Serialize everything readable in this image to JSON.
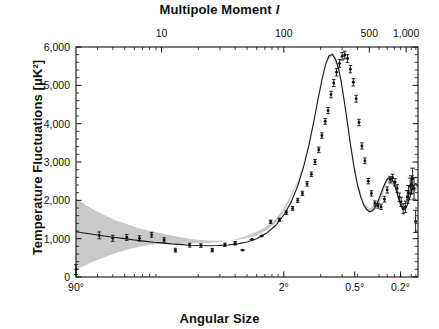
{
  "figure": {
    "top_axis_title_text": "Multipole Moment",
    "top_axis_title_symbol": "l",
    "bottom_axis_title": "Angular Size",
    "y_axis_title": "Temperature Fluctuations [μK²]"
  },
  "chart_data": {
    "type": "line",
    "title": "",
    "subtitle": "",
    "xlabel": "Angular Size",
    "ylabel": "Temperature Fluctuations [μK²]",
    "x_top_label": "Multipole Moment l",
    "x_scale": "log",
    "y_scale": "linear",
    "xlim": [
      2,
      1250
    ],
    "ylim": [
      0,
      6000
    ],
    "grid": false,
    "legend": null,
    "legend_position": "none",
    "top_axis_ticks": [
      {
        "value": 10,
        "label": "10"
      },
      {
        "value": 100,
        "label": "100"
      },
      {
        "value": 500,
        "label": "500"
      },
      {
        "value": 1000,
        "label": "1,000"
      }
    ],
    "top_axis_minor_ticks": [
      3,
      4,
      5,
      6,
      7,
      8,
      9,
      20,
      30,
      40,
      50,
      60,
      70,
      80,
      90,
      200,
      300,
      400,
      600,
      700,
      800,
      900,
      1100,
      1200
    ],
    "bottom_axis_ticks": [
      {
        "value": 2,
        "label": "90°"
      },
      {
        "value": 100,
        "label": "2°"
      },
      {
        "value": 380,
        "label": "0.5°"
      },
      {
        "value": 900,
        "label": "0.2°"
      }
    ],
    "y_ticks": [
      {
        "value": 0,
        "label": "0"
      },
      {
        "value": 1000,
        "label": "1,000"
      },
      {
        "value": 2000,
        "label": "2,000"
      },
      {
        "value": 3000,
        "label": "3,000"
      },
      {
        "value": 4000,
        "label": "4,000"
      },
      {
        "value": 5000,
        "label": "5,000"
      },
      {
        "value": 6000,
        "label": "6,000"
      }
    ],
    "y_minor_tick_step": 200,
    "series": [
      {
        "name": "Best-fit model",
        "type": "line",
        "color": "#1a1a1a",
        "x": [
          2,
          2.4,
          2.9,
          3.5,
          4.2,
          5,
          6,
          7.2,
          8.6,
          10,
          12,
          14,
          17,
          20,
          24,
          29,
          35,
          42,
          50,
          60,
          72,
          86,
          100,
          115,
          130,
          145,
          160,
          175,
          190,
          205,
          220,
          235,
          250,
          265,
          280,
          295,
          310,
          330,
          350,
          375,
          400,
          425,
          450,
          475,
          500,
          525,
          550,
          575,
          600,
          625,
          650,
          675,
          700,
          725,
          750,
          775,
          800,
          825,
          850,
          875,
          900,
          930,
          960,
          990,
          1020,
          1060,
          1100,
          1150,
          1200,
          1250
        ],
        "y": [
          1180,
          1140,
          1100,
          1065,
          1030,
          1000,
          965,
          935,
          905,
          890,
          865,
          850,
          830,
          820,
          815,
          820,
          835,
          865,
          915,
          1000,
          1140,
          1350,
          1620,
          1960,
          2380,
          2870,
          3420,
          4020,
          4620,
          5150,
          5560,
          5780,
          5800,
          5680,
          5440,
          5080,
          4640,
          4060,
          3470,
          2860,
          2400,
          2090,
          1880,
          1760,
          1710,
          1720,
          1790,
          1900,
          2040,
          2190,
          2340,
          2460,
          2550,
          2590,
          2580,
          2520,
          2420,
          2290,
          2150,
          2010,
          1890,
          1800,
          1760,
          1790,
          1880,
          2030,
          2200,
          2380,
          2440,
          2380
        ]
      }
    ],
    "uncertainty_band": {
      "name": "Cosmic variance",
      "color": "#c9c9c9",
      "x": [
        2,
        2.4,
        2.9,
        3.5,
        4.2,
        5,
        6,
        7.2,
        8.6,
        10,
        12,
        14,
        17,
        20,
        24,
        29,
        35,
        42,
        50,
        60,
        72,
        86,
        100,
        130,
        160,
        190,
        220,
        250,
        280,
        310,
        350,
        400,
        450,
        500,
        560,
        620,
        700,
        800,
        900,
        1000,
        1100,
        1250
      ],
      "upper": [
        2050,
        1880,
        1720,
        1600,
        1480,
        1400,
        1310,
        1240,
        1180,
        1140,
        1085,
        1045,
        1000,
        975,
        955,
        945,
        950,
        970,
        1010,
        1085,
        1215,
        1415,
        1680,
        2440,
        3480,
        4690,
        5620,
        5880,
        5520,
        4720,
        3560,
        2480,
        1960,
        1790,
        1870,
        2130,
        2620,
        2480,
        1920,
        1830,
        2250,
        2420
      ],
      "lower": [
        180,
        310,
        430,
        530,
        620,
        690,
        760,
        810,
        850,
        870,
        870,
        870,
        875,
        880,
        890,
        910,
        945,
        1000,
        1080,
        1180,
        1320,
        1520,
        1790,
        2500,
        3500,
        4680,
        5570,
        5790,
        5430,
        4620,
        3420,
        2340,
        1830,
        1660,
        1740,
        2000,
        2490,
        2360,
        1800,
        1720,
        2130,
        2310
      ]
    },
    "data_points": [
      {
        "x": 2,
        "y": 195,
        "yerr_low": 130,
        "yerr_high": 130
      },
      {
        "x": 3.1,
        "y": 1085,
        "yerr_low": 90,
        "yerr_high": 90
      },
      {
        "x": 4.0,
        "y": 1010,
        "yerr_low": 80,
        "yerr_high": 80
      },
      {
        "x": 5.2,
        "y": 1030,
        "yerr_low": 75,
        "yerr_high": 75
      },
      {
        "x": 6.6,
        "y": 1005,
        "yerr_low": 70,
        "yerr_high": 70
      },
      {
        "x": 8.3,
        "y": 1100,
        "yerr_low": 65,
        "yerr_high": 65
      },
      {
        "x": 10.5,
        "y": 965,
        "yerr_low": 60,
        "yerr_high": 60
      },
      {
        "x": 13,
        "y": 700,
        "yerr_low": 50,
        "yerr_high": 50
      },
      {
        "x": 17,
        "y": 830,
        "yerr_low": 50,
        "yerr_high": 50
      },
      {
        "x": 21,
        "y": 820,
        "yerr_low": 45,
        "yerr_high": 45
      },
      {
        "x": 26,
        "y": 700,
        "yerr_low": 45,
        "yerr_high": 45
      },
      {
        "x": 33,
        "y": 840,
        "yerr_low": 45,
        "yerr_high": 45
      },
      {
        "x": 40,
        "y": 880,
        "yerr_low": 45,
        "yerr_high": 45
      },
      {
        "x": 46,
        "y": 700,
        "yerr_low": 40,
        "yerr_high": 40
      },
      {
        "x": 55,
        "y": 980,
        "yerr_low": 40,
        "yerr_high": 40
      },
      {
        "x": 66,
        "y": 1070,
        "yerr_low": 40,
        "yerr_high": 40
      },
      {
        "x": 78,
        "y": 1440,
        "yerr_low": 45,
        "yerr_high": 45
      },
      {
        "x": 92,
        "y": 1490,
        "yerr_low": 45,
        "yerr_high": 45
      },
      {
        "x": 105,
        "y": 1680,
        "yerr_low": 50,
        "yerr_high": 50
      },
      {
        "x": 118,
        "y": 1790,
        "yerr_low": 50,
        "yerr_high": 50
      },
      {
        "x": 130,
        "y": 2000,
        "yerr_low": 55,
        "yerr_high": 55
      },
      {
        "x": 142,
        "y": 2180,
        "yerr_low": 55,
        "yerr_high": 55
      },
      {
        "x": 155,
        "y": 2430,
        "yerr_low": 60,
        "yerr_high": 60
      },
      {
        "x": 168,
        "y": 2680,
        "yerr_low": 60,
        "yerr_high": 60
      },
      {
        "x": 180,
        "y": 3000,
        "yerr_low": 65,
        "yerr_high": 65
      },
      {
        "x": 193,
        "y": 3320,
        "yerr_low": 70,
        "yerr_high": 70
      },
      {
        "x": 205,
        "y": 3690,
        "yerr_low": 70,
        "yerr_high": 70
      },
      {
        "x": 218,
        "y": 4060,
        "yerr_low": 75,
        "yerr_high": 75
      },
      {
        "x": 230,
        "y": 4340,
        "yerr_low": 80,
        "yerr_high": 80
      },
      {
        "x": 243,
        "y": 4760,
        "yerr_low": 85,
        "yerr_high": 85
      },
      {
        "x": 256,
        "y": 5060,
        "yerr_low": 90,
        "yerr_high": 90
      },
      {
        "x": 270,
        "y": 5340,
        "yerr_low": 95,
        "yerr_high": 95
      },
      {
        "x": 285,
        "y": 5570,
        "yerr_low": 100,
        "yerr_high": 100
      },
      {
        "x": 300,
        "y": 5760,
        "yerr_low": 100,
        "yerr_high": 100
      },
      {
        "x": 315,
        "y": 5790,
        "yerr_low": 100,
        "yerr_high": 100
      },
      {
        "x": 332,
        "y": 5700,
        "yerr_low": 100,
        "yerr_high": 100
      },
      {
        "x": 350,
        "y": 5420,
        "yerr_low": 95,
        "yerr_high": 95
      },
      {
        "x": 370,
        "y": 5080,
        "yerr_low": 95,
        "yerr_high": 95
      },
      {
        "x": 390,
        "y": 4650,
        "yerr_low": 90,
        "yerr_high": 90
      },
      {
        "x": 412,
        "y": 4030,
        "yerr_low": 85,
        "yerr_high": 85
      },
      {
        "x": 435,
        "y": 3420,
        "yerr_low": 80,
        "yerr_high": 80
      },
      {
        "x": 460,
        "y": 3030,
        "yerr_low": 75,
        "yerr_high": 75
      },
      {
        "x": 490,
        "y": 2500,
        "yerr_low": 70,
        "yerr_high": 70
      },
      {
        "x": 520,
        "y": 2180,
        "yerr_low": 70,
        "yerr_high": 70
      },
      {
        "x": 555,
        "y": 1920,
        "yerr_low": 65,
        "yerr_high": 65
      },
      {
        "x": 590,
        "y": 1860,
        "yerr_low": 65,
        "yerr_high": 65
      },
      {
        "x": 625,
        "y": 1830,
        "yerr_low": 70,
        "yerr_high": 70
      },
      {
        "x": 665,
        "y": 2030,
        "yerr_low": 75,
        "yerr_high": 75
      },
      {
        "x": 700,
        "y": 2270,
        "yerr_low": 80,
        "yerr_high": 80
      },
      {
        "x": 740,
        "y": 2540,
        "yerr_low": 85,
        "yerr_high": 85
      },
      {
        "x": 775,
        "y": 2590,
        "yerr_low": 90,
        "yerr_high": 90
      },
      {
        "x": 810,
        "y": 2470,
        "yerr_low": 95,
        "yerr_high": 95
      },
      {
        "x": 845,
        "y": 2310,
        "yerr_low": 100,
        "yerr_high": 100
      },
      {
        "x": 880,
        "y": 2080,
        "yerr_low": 110,
        "yerr_high": 110
      },
      {
        "x": 910,
        "y": 1960,
        "yerr_low": 120,
        "yerr_high": 120
      },
      {
        "x": 945,
        "y": 1780,
        "yerr_low": 130,
        "yerr_high": 130
      },
      {
        "x": 985,
        "y": 1830,
        "yerr_low": 150,
        "yerr_high": 150
      },
      {
        "x": 1020,
        "y": 2090,
        "yerr_low": 165,
        "yerr_high": 165
      },
      {
        "x": 1045,
        "y": 2200,
        "yerr_low": 185,
        "yerr_high": 185
      },
      {
        "x": 1080,
        "y": 2370,
        "yerr_low": 210,
        "yerr_high": 210
      },
      {
        "x": 1105,
        "y": 2410,
        "yerr_low": 230,
        "yerr_high": 230
      },
      {
        "x": 1130,
        "y": 2570,
        "yerr_low": 270,
        "yerr_high": 270
      },
      {
        "x": 1160,
        "y": 2310,
        "yerr_low": 280,
        "yerr_high": 280
      },
      {
        "x": 1195,
        "y": 1450,
        "yerr_low": 290,
        "yerr_high": 290
      }
    ]
  }
}
